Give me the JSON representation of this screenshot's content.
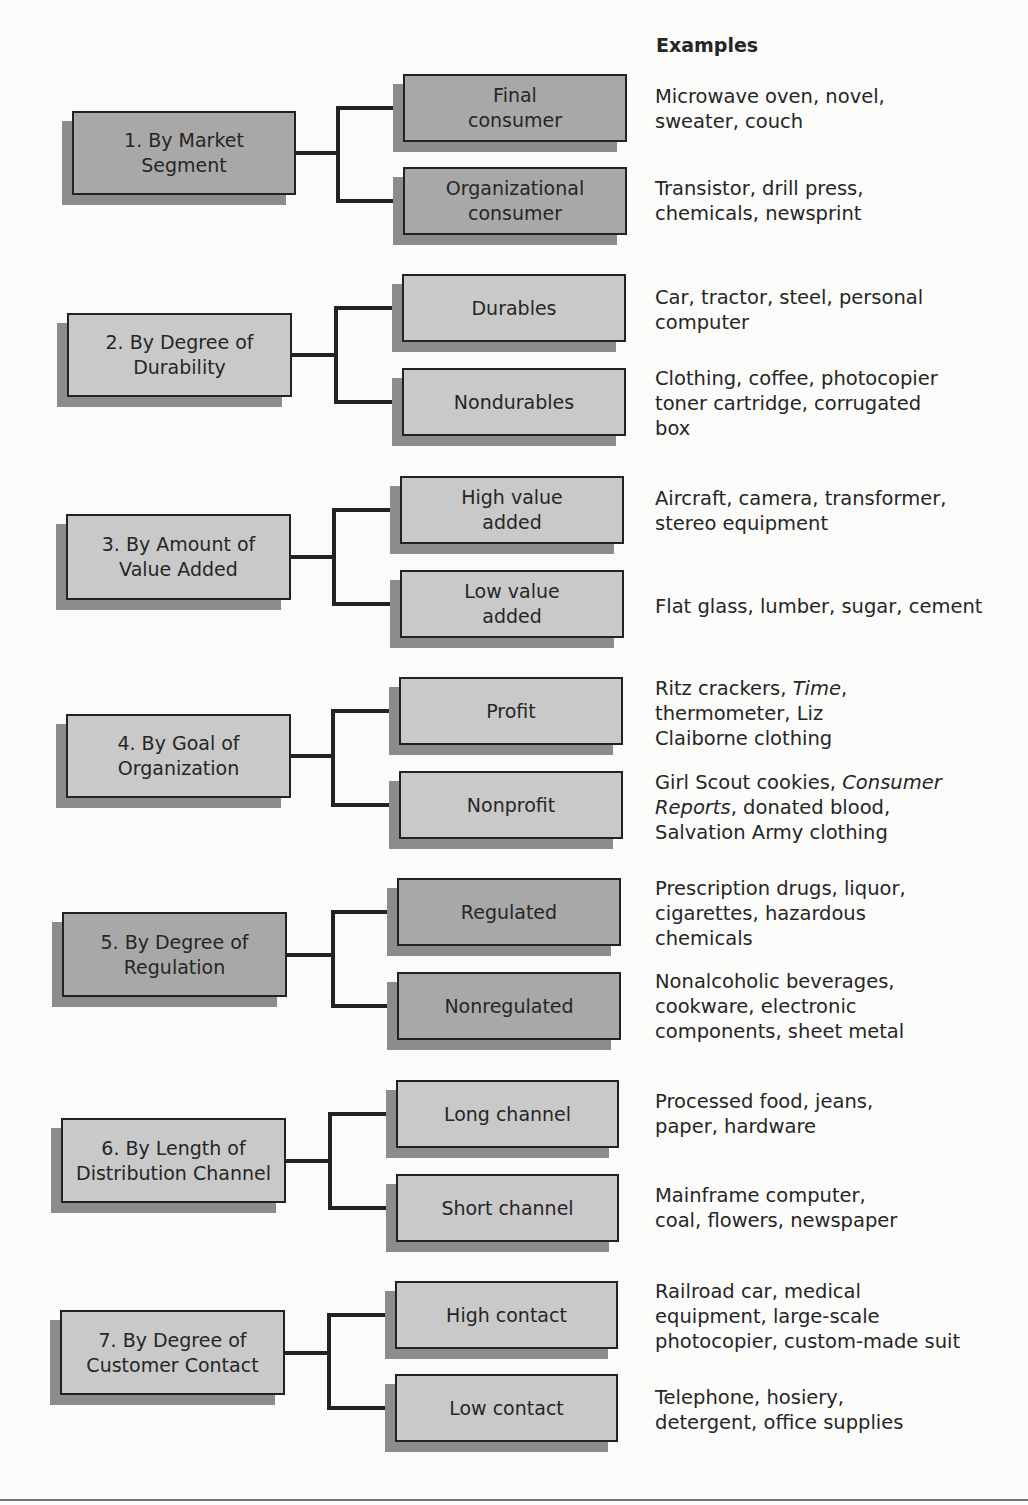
{
  "header": {
    "examples_label": "Examples"
  },
  "colors": {
    "light_fill": "#c9c9c9",
    "dark_fill": "#a8a8a8",
    "shadow": "#8c8c8c",
    "line": "#222222"
  },
  "groups": [
    {
      "label": "1. By Market\nSegment",
      "shade": "dark",
      "main": [
        72,
        111,
        224,
        84
      ],
      "children_x": 403,
      "child_w": 224,
      "join_x": 338,
      "children": [
        {
          "label": "Final\nconsumer",
          "y": 74,
          "example": "Microwave oven, novel,\nsweater, couch",
          "ex_y": 84
        },
        {
          "label": "Organizational\nconsumer",
          "y": 167,
          "example": "Transistor, drill press,\nchemicals, newsprint",
          "ex_y": 176
        }
      ]
    },
    {
      "label": "2. By Degree of\nDurability",
      "shade": "light",
      "main": [
        67,
        313,
        225,
        84
      ],
      "children_x": 402,
      "child_w": 224,
      "join_x": 336,
      "children": [
        {
          "label": "Durables",
          "y": 274,
          "example": "Car, tractor, steel, personal\ncomputer",
          "ex_y": 285
        },
        {
          "label": "Nondurables",
          "y": 368,
          "example": "Clothing, coffee, photocopier\ntoner cartridge, corrugated\nbox",
          "ex_y": 366
        }
      ]
    },
    {
      "label": "3. By Amount of\nValue Added",
      "shade": "light",
      "main": [
        66,
        514,
        225,
        86
      ],
      "children_x": 400,
      "child_w": 224,
      "join_x": 334,
      "children": [
        {
          "label": "High value\nadded",
          "y": 476,
          "example": "Aircraft, camera, transformer,\nstereo equipment",
          "ex_y": 486
        },
        {
          "label": "Low value\nadded",
          "y": 570,
          "example": "Flat glass, lumber, sugar, cement",
          "ex_y": 594
        }
      ]
    },
    {
      "label": "4. By Goal of\nOrganization",
      "shade": "light",
      "main": [
        66,
        714,
        225,
        84
      ],
      "children_x": 399,
      "child_w": 224,
      "join_x": 333,
      "children": [
        {
          "label": "Profit",
          "y": 677,
          "example_parts": [
            [
              "Ritz crackers, ",
              false
            ],
            [
              "Time",
              true
            ],
            [
              ",\nthermometer, Liz\nClaiborne clothing",
              false
            ]
          ],
          "ex_y": 676
        },
        {
          "label": "Nonprofit",
          "y": 771,
          "example_parts": [
            [
              "Girl Scout cookies, ",
              false
            ],
            [
              "Consumer\nReports",
              true
            ],
            [
              ", donated blood,\nSalvation Army clothing",
              false
            ]
          ],
          "ex_y": 770
        }
      ]
    },
    {
      "label": "5. By Degree of\nRegulation",
      "shade": "dark",
      "main": [
        62,
        912,
        225,
        85
      ],
      "children_x": 397,
      "child_w": 224,
      "join_x": 333,
      "children": [
        {
          "label": "Regulated",
          "y": 878,
          "example": "Prescription drugs, liquor,\ncigarettes, hazardous\nchemicals",
          "ex_y": 876
        },
        {
          "label": "Nonregulated",
          "y": 972,
          "example": "Nonalcoholic beverages,\ncookware, electronic\ncomponents, sheet metal",
          "ex_y": 969
        }
      ]
    },
    {
      "label": "6. By Length of\nDistribution Channel",
      "shade": "light",
      "main": [
        61,
        1118,
        225,
        85
      ],
      "children_x": 396,
      "child_w": 223,
      "join_x": 330,
      "children": [
        {
          "label": "Long channel",
          "y": 1080,
          "example": "Processed food, jeans,\npaper, hardware",
          "ex_y": 1089
        },
        {
          "label": "Short channel",
          "y": 1174,
          "example": "Mainframe computer,\ncoal, flowers, newspaper",
          "ex_y": 1183
        }
      ]
    },
    {
      "label": "7. By Degree of\nCustomer Contact",
      "shade": "light",
      "main": [
        60,
        1310,
        225,
        85
      ],
      "children_x": 395,
      "child_w": 223,
      "join_x": 329,
      "children": [
        {
          "label": "High contact",
          "y": 1281,
          "example": "Railroad car, medical\nequipment, large-scale\nphotocopier, custom-made suit",
          "ex_y": 1279
        },
        {
          "label": "Low contact",
          "y": 1374,
          "example": "Telephone, hosiery,\ndetergent, office supplies",
          "ex_y": 1385
        }
      ]
    }
  ]
}
